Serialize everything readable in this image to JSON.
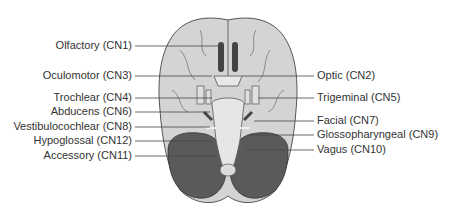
{
  "figure": {
    "colors": {
      "cerebrum": "#d4d4d4",
      "cerebrum_outline": "#555555",
      "cerebellum": "#5a5a5a",
      "brainstem": "#e6e6e6",
      "leader_line": "#444444",
      "text": "#333333"
    }
  },
  "labels": {
    "left": [
      {
        "text": "Olfactory (CN1)",
        "y": 45
      },
      {
        "text": "Oculomotor (CN3)",
        "y": 75
      },
      {
        "text": "Trochlear (CN4)",
        "y": 97
      },
      {
        "text": "Abducens (CN6)",
        "y": 111
      },
      {
        "text": "Vestibulocochlear (CN8)",
        "y": 126
      },
      {
        "text": "Hypoglossal (CN12)",
        "y": 140
      },
      {
        "text": "Accessory (CN11)",
        "y": 155
      }
    ],
    "right": [
      {
        "text": "Optic (CN2)",
        "y": 75
      },
      {
        "text": "Trigeminal (CN5)",
        "y": 97
      },
      {
        "text": "Facial (CN7)",
        "y": 120
      },
      {
        "text": "Glossopharyngeal (CN9)",
        "y": 134
      },
      {
        "text": "Vagus (CN10)",
        "y": 149
      }
    ]
  }
}
